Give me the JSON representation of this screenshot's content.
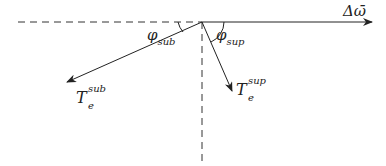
{
  "diagram": {
    "type": "vector-angle-diagram",
    "origin": {
      "x": 202,
      "y": 22
    },
    "colors": {
      "line": "#222222",
      "dashed": "#333333",
      "background": "#ffffff"
    },
    "vectors": [
      {
        "id": "delta-omega",
        "label": "Δω̄",
        "from": [
          202,
          22
        ],
        "to": [
          372,
          22
        ],
        "style": "solid-arrow"
      },
      {
        "id": "T-e-sub",
        "label_base": "T",
        "label_sup": "sub",
        "label_sub": "e",
        "from": [
          202,
          22
        ],
        "to": [
          67,
          82
        ],
        "style": "solid-arrow"
      },
      {
        "id": "T-e-sup",
        "label_base": "T",
        "label_sup": "sup",
        "label_sub": "e",
        "from": [
          202,
          22
        ],
        "to": [
          232,
          91
        ],
        "style": "solid-arrow"
      }
    ],
    "reference_lines": [
      {
        "id": "horizontal-ref",
        "from": [
          18,
          22
        ],
        "to": [
          202,
          22
        ],
        "style": "dashed"
      },
      {
        "id": "vertical-ref",
        "from": [
          202,
          22
        ],
        "to": [
          202,
          166
        ],
        "style": "dashed"
      }
    ],
    "angles": [
      {
        "id": "phi-sub",
        "base": "φ",
        "subscript": "sub"
      },
      {
        "id": "phi-sup",
        "base": "φ",
        "subscript": "sup"
      }
    ]
  }
}
